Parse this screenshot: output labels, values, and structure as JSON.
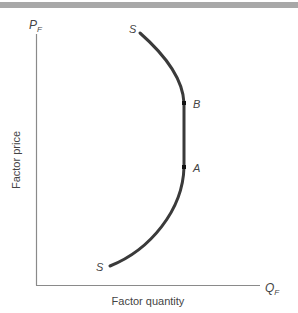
{
  "diagram": {
    "axes": {
      "y_label": "P",
      "y_label_sub": "F",
      "x_label": "Q",
      "x_label_sub": "F",
      "y_title": "Factor price",
      "x_title": "Factor quantity"
    },
    "curve": {
      "top_label": "S",
      "bottom_label": "S",
      "point_b": "B",
      "point_a": "A"
    },
    "colors": {
      "curve": "#3a3a3a",
      "axis": "#8a8a8a",
      "header_bar": "#a8a8a8"
    }
  }
}
